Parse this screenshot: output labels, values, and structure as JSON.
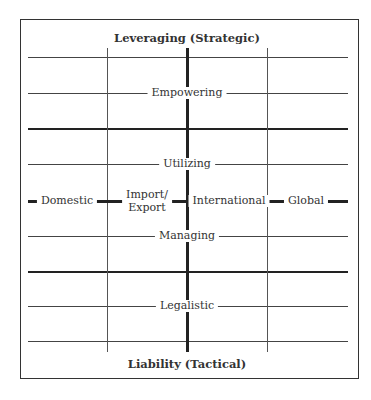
{
  "cropped_caption": "...pping of capabilities by orientation...",
  "diagram": {
    "top_label": "Leveraging (Strategic)",
    "bottom_label": "Liability (Tactical)",
    "levels": [
      "Empowering",
      "Utilizing",
      "Managing",
      "Legalistic"
    ],
    "scope": [
      "Domestic",
      "Import/",
      "Export",
      "International",
      "Global"
    ]
  }
}
